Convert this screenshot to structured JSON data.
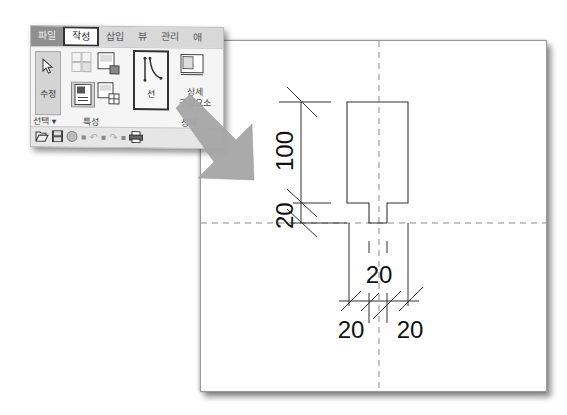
{
  "ribbon": {
    "tabs": [
      {
        "label": "파일",
        "state": "file"
      },
      {
        "label": "작성",
        "state": "active"
      },
      {
        "label": "삽입",
        "state": "normal"
      },
      {
        "label": "뷰",
        "state": "normal"
      },
      {
        "label": "관리",
        "state": "normal"
      },
      {
        "label": "애",
        "state": "normal"
      }
    ],
    "modify_button": {
      "label": "수정",
      "icon": "cursor-arrow-icon"
    },
    "select_group": {
      "label": "선택 ▾"
    },
    "properties_group": {
      "label": "특성"
    },
    "line_button": {
      "label": "선",
      "icon": "line-tool-icon",
      "highlighted": true
    },
    "detail_component": {
      "label_line1": "상세",
      "label_line2": "구성요소"
    },
    "detail_group_label": "상세"
  },
  "quick_access_toolbar": {
    "items": [
      {
        "name": "open",
        "glyph": "📂"
      },
      {
        "name": "save",
        "glyph": "💾"
      },
      {
        "name": "sync",
        "glyph": "◍"
      },
      {
        "name": "undo",
        "glyph": "↶"
      },
      {
        "name": "redo",
        "glyph": "↷"
      },
      {
        "name": "print",
        "glyph": "🖶"
      }
    ]
  },
  "drawing": {
    "dimensions": {
      "vertical_upper": "100",
      "vertical_lower": "20",
      "horizontal_center": "20",
      "horizontal_left": "20",
      "horizontal_right": "20"
    },
    "colors": {
      "line": "#333333",
      "centerline": "#888888",
      "arrow": "#a6a6a6"
    }
  }
}
